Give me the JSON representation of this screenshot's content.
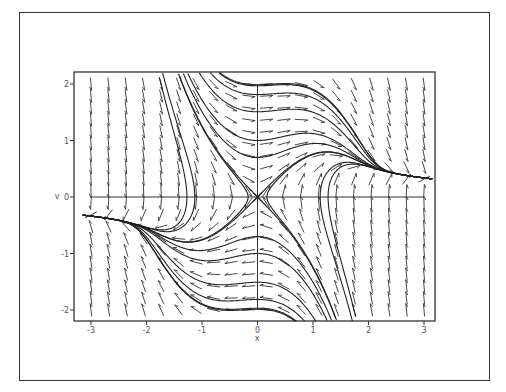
{
  "chart_data": {
    "type": "direction_field",
    "title": "",
    "xlabel": "x",
    "ylabel": "v",
    "system": {
      "dx_dt": "v",
      "dv_dt": "x - x^2*v"
    },
    "xlim": [
      -3.2,
      3.2
    ],
    "ylim": [
      -2.2,
      2.2
    ],
    "xticks": [
      -3,
      -2,
      -1,
      0,
      1,
      2,
      3
    ],
    "yticks": [
      -2,
      -1,
      0,
      1,
      2
    ],
    "xtick_labels": [
      "-3",
      "-2",
      "-1",
      "0",
      "1",
      "2",
      "3"
    ],
    "ytick_labels": [
      "-2",
      "-1",
      "0",
      "1",
      "2"
    ],
    "grid": false,
    "legend": null,
    "arrow_grid": {
      "cols": 20,
      "rows": 20,
      "x_range": [
        -3,
        3
      ],
      "y_range": [
        -2,
        2
      ]
    },
    "trajectory_seeds": [
      [
        -1.05,
        2.2
      ],
      [
        -0.85,
        2.2
      ],
      [
        -0.7,
        2.2
      ],
      [
        1.05,
        -2.2
      ],
      [
        0.85,
        -2.2
      ],
      [
        0.7,
        -2.2
      ],
      [
        0.3,
        2.0
      ],
      [
        -0.3,
        -2.0
      ],
      [
        0.0,
        1.0
      ],
      [
        0.0,
        -1.0
      ],
      [
        0.0,
        0.7
      ],
      [
        0.0,
        -0.7
      ],
      [
        0.02,
        0.02
      ],
      [
        -0.02,
        -0.02
      ],
      [
        -0.5,
        0.5
      ],
      [
        0.5,
        -0.5
      ],
      [
        1.15,
        0.2
      ],
      [
        -1.15,
        -0.2
      ],
      [
        1.3,
        -0.3
      ],
      [
        -1.3,
        0.3
      ]
    ],
    "colors": {
      "arrows": "#333333",
      "trajectories": "#222222",
      "axes": "#333333",
      "frame": "#333333"
    }
  }
}
